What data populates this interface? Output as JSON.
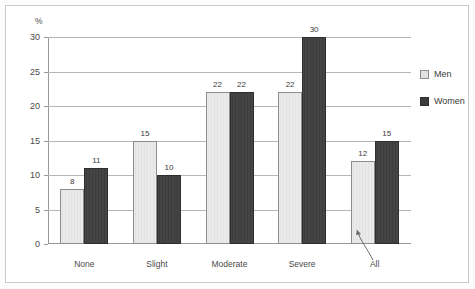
{
  "chart_data": {
    "type": "bar",
    "title": "",
    "subtitle": "",
    "xlabel": "",
    "ylabel": "%",
    "ylim": [
      0,
      30
    ],
    "yticks": [
      0,
      5,
      10,
      15,
      20,
      25,
      30
    ],
    "ytick_labels": [
      "0",
      "5",
      "10",
      "15",
      "20",
      "25",
      "30"
    ],
    "grid": true,
    "legend_position": "right",
    "categories": [
      "None",
      "Slight",
      "Moderate",
      "Severe",
      "All"
    ],
    "series": [
      {
        "name": "Men",
        "color": "#e2e2e2",
        "values": [
          8,
          15,
          22,
          22,
          12
        ],
        "value_labels": [
          "8",
          "15",
          "22",
          "22",
          "12"
        ]
      },
      {
        "name": "Women",
        "color": "#3c3c3c",
        "values": [
          11,
          10,
          22,
          30,
          15
        ],
        "value_labels": [
          "11",
          "10",
          "22",
          "30",
          "15"
        ]
      }
    ],
    "annotations": [
      {
        "name": "all-leader-line",
        "text": "All",
        "target_category": "All"
      }
    ]
  },
  "axis": {
    "y_unit_label": "%"
  },
  "legend": {
    "items": [
      {
        "label": "Men",
        "swatch": "light-gray-swatch"
      },
      {
        "label": "Women",
        "swatch": "dark-gray-swatch"
      }
    ]
  }
}
